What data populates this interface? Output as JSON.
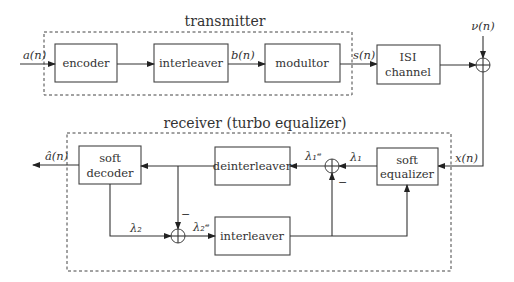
{
  "transmitter": {
    "title": "transmitter",
    "blocks": {
      "encoder": "encoder",
      "interleaver": "interleaver",
      "modulator": "modultor"
    },
    "signals": {
      "input": "a(n)",
      "interleaved": "b(n)",
      "modulated": "s(n)"
    }
  },
  "channel": {
    "line1": "ISI",
    "line2": "channel",
    "noise": "ν(n)",
    "output": "x(n)"
  },
  "receiver": {
    "title": "receiver (turbo equalizer)",
    "blocks": {
      "soft_decoder_l1": "soft",
      "soft_decoder_l2": "decoder",
      "deinterleaver": "deinterleaver",
      "soft_equalizer_l1": "soft",
      "soft_equalizer_l2": "equalizer",
      "interleaver": "interleaver"
    },
    "signals": {
      "estimate": "â(n)",
      "lambda1": "λ₁",
      "lambda1e": "λ₁ᵉ",
      "lambda2": "λ₂",
      "lambda2e": "λ₂ᵉ",
      "minus": "−"
    }
  }
}
